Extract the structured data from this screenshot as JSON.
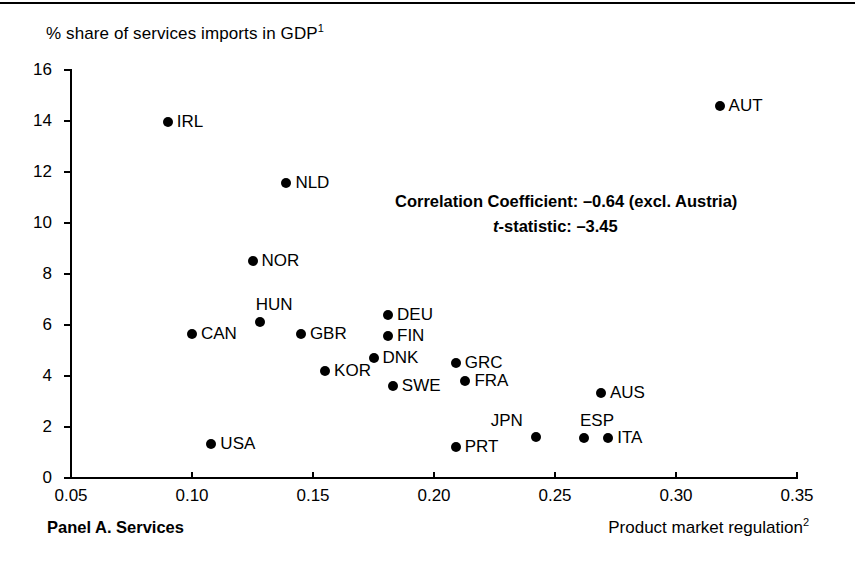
{
  "chart_data": {
    "type": "scatter",
    "title": "",
    "panel_caption": "Panel A. Services",
    "ylabel": "% share of services imports in GDP",
    "ylabel_superscript": "1",
    "xlabel": "Product market regulation",
    "xlabel_superscript": "2",
    "xlim": [
      0.05,
      0.35
    ],
    "ylim": [
      0,
      16
    ],
    "xticks": [
      "0.05",
      "0.10",
      "0.15",
      "0.20",
      "0.25",
      "0.30",
      "0.35"
    ],
    "xtick_values": [
      0.05,
      0.1,
      0.15,
      0.2,
      0.25,
      0.3,
      0.35
    ],
    "yticks": [
      "0",
      "2",
      "4",
      "6",
      "8",
      "10",
      "12",
      "14",
      "16"
    ],
    "ytick_values": [
      0,
      2,
      4,
      6,
      8,
      10,
      12,
      14,
      16
    ],
    "grid": false,
    "legend": false,
    "marker_color": "#000000",
    "annotations": [
      "Correlation Coefficient: –0.64  (excl. Austria)",
      "t-statistic: –3.45"
    ],
    "correlation_coefficient": -0.64,
    "t_statistic": -3.45,
    "points": [
      {
        "label": "AUT",
        "x": 0.318,
        "y": 14.6,
        "label_side": "right"
      },
      {
        "label": "IRL",
        "x": 0.09,
        "y": 13.95,
        "label_side": "right"
      },
      {
        "label": "NLD",
        "x": 0.139,
        "y": 11.55,
        "label_side": "right"
      },
      {
        "label": "NOR",
        "x": 0.125,
        "y": 8.5,
        "label_side": "right"
      },
      {
        "label": "DEU",
        "x": 0.181,
        "y": 6.4,
        "label_side": "right"
      },
      {
        "label": "HUN",
        "x": 0.128,
        "y": 6.1,
        "label_side": "above"
      },
      {
        "label": "CAN",
        "x": 0.1,
        "y": 5.65,
        "label_side": "right"
      },
      {
        "label": "GBR",
        "x": 0.145,
        "y": 5.65,
        "label_side": "right"
      },
      {
        "label": "FIN",
        "x": 0.181,
        "y": 5.55,
        "label_side": "right"
      },
      {
        "label": "DNK",
        "x": 0.175,
        "y": 4.7,
        "label_side": "right"
      },
      {
        "label": "GRC",
        "x": 0.209,
        "y": 4.5,
        "label_side": "right"
      },
      {
        "label": "KOR",
        "x": 0.155,
        "y": 4.2,
        "label_side": "right"
      },
      {
        "label": "FRA",
        "x": 0.213,
        "y": 3.8,
        "label_side": "right"
      },
      {
        "label": "SWE",
        "x": 0.183,
        "y": 3.6,
        "label_side": "right"
      },
      {
        "label": "AUS",
        "x": 0.269,
        "y": 3.35,
        "label_side": "right"
      },
      {
        "label": "ITA",
        "x": 0.272,
        "y": 1.55,
        "label_side": "right"
      },
      {
        "label": "ESP",
        "x": 0.262,
        "y": 1.55,
        "label_side": "above"
      },
      {
        "label": "JPN",
        "x": 0.242,
        "y": 1.6,
        "label_side": "above-left"
      },
      {
        "label": "USA",
        "x": 0.108,
        "y": 1.35,
        "label_side": "right"
      },
      {
        "label": "PRT",
        "x": 0.209,
        "y": 1.2,
        "label_side": "right"
      }
    ]
  }
}
